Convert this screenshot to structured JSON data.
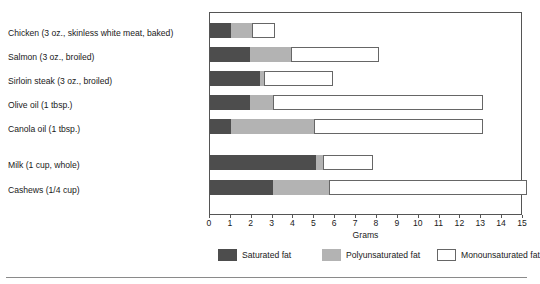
{
  "top_partial_text": {
    "left": "",
    "right": ""
  },
  "legend": {
    "position": "bottom-center",
    "items": [
      {
        "key": "sat",
        "label": "Saturated fat",
        "color": "#4d4d4d"
      },
      {
        "key": "poly",
        "label": "Polyunsaturated fat",
        "color": "#b3b3b3"
      },
      {
        "key": "mono",
        "label": "Monounsaturated fat",
        "color": "#ffffff"
      }
    ]
  },
  "chart_data": {
    "type": "bar",
    "orientation": "horizontal",
    "stacked": true,
    "title": "",
    "xlabel": "Grams",
    "ylabel": "",
    "xlim": [
      0,
      15
    ],
    "ylim": null,
    "grid": false,
    "xticks": [
      0,
      1,
      2,
      3,
      4,
      5,
      6,
      7,
      8,
      9,
      10,
      11,
      12,
      13,
      14,
      15
    ],
    "xtick_labels": [
      "0",
      "1",
      "2",
      "3",
      "4",
      "5",
      "6",
      "7",
      "8",
      "9",
      "10",
      "11",
      "12",
      "13",
      "14",
      "15"
    ],
    "categories": [
      "Chicken (3 oz., skinless white meat, baked)",
      "Salmon (3 oz., broiled)",
      "Sirloin steak (3 oz., broiled)",
      "Olive oil (1 tbsp.)",
      "Canola oil (1 tbsp.)",
      "Milk (1 cup, whole)",
      "Cashews (1/4 cup)"
    ],
    "series": [
      {
        "name": "Saturated fat",
        "color": "#4d4d4d",
        "values": [
          1.0,
          1.9,
          2.4,
          1.9,
          1.0,
          5.1,
          3.0
        ]
      },
      {
        "name": "Polyunsaturated fat",
        "color": "#b3b3b3",
        "values": [
          1.0,
          2.0,
          0.2,
          1.1,
          4.0,
          0.3,
          2.7
        ]
      },
      {
        "name": "Monounsaturated fat",
        "color": "#ffffff",
        "values": [
          1.1,
          4.2,
          3.3,
          10.1,
          8.1,
          2.4,
          9.5
        ]
      }
    ],
    "totals": [
      3.1,
      8.1,
      5.9,
      13.1,
      13.1,
      7.8,
      15.2
    ]
  }
}
